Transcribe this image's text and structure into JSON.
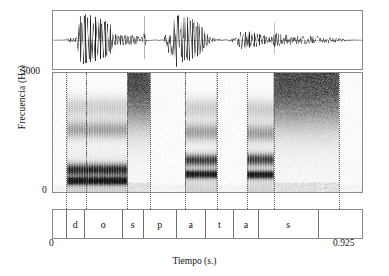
{
  "figure": {
    "type": "speech-spectrogram",
    "caption_language": "es"
  },
  "axes": {
    "y_label": "Frecuencia (Hz)",
    "y_ticks": [
      "5000",
      "0"
    ],
    "y_min": 0,
    "y_max": 5000,
    "x_label": "Tiempo (s.)",
    "x_ticks": [
      "0",
      "0.925"
    ],
    "x_min": 0,
    "x_max": 0.925
  },
  "segmentation": {
    "label_row": [
      {
        "label": "",
        "start": 0.0,
        "end": 0.042
      },
      {
        "label": "d",
        "start": 0.042,
        "end": 0.1
      },
      {
        "label": "o",
        "start": 0.1,
        "end": 0.222
      },
      {
        "label": "s",
        "start": 0.222,
        "end": 0.29
      },
      {
        "label": "p",
        "start": 0.29,
        "end": 0.395
      },
      {
        "label": "a",
        "start": 0.395,
        "end": 0.49
      },
      {
        "label": "t",
        "start": 0.49,
        "end": 0.58
      },
      {
        "label": "a",
        "start": 0.58,
        "end": 0.66
      },
      {
        "label": "s",
        "start": 0.66,
        "end": 0.855
      },
      {
        "label": "",
        "start": 0.855,
        "end": 0.925
      }
    ],
    "utterance": "dos patas"
  },
  "chart_data": {
    "type": "line",
    "title": "",
    "xlabel": "Tiempo (s.)",
    "ylabel": "Frecuencia (Hz)",
    "xlim": [
      0,
      0.925
    ],
    "ylim": [
      0,
      5000
    ],
    "grid": false,
    "panels": [
      {
        "name": "waveform",
        "type": "line",
        "ylabel": "",
        "description": "Oscillogram of the Spanish utterance 'dos patas'",
        "envelope": [
          [
            0.0,
            0.01
          ],
          [
            0.03,
            0.01
          ],
          [
            0.04,
            0.05
          ],
          [
            0.055,
            0.09
          ],
          [
            0.068,
            0.07
          ],
          [
            0.08,
            0.9
          ],
          [
            0.095,
            0.97
          ],
          [
            0.11,
            0.93
          ],
          [
            0.125,
            0.88
          ],
          [
            0.14,
            0.8
          ],
          [
            0.155,
            0.72
          ],
          [
            0.17,
            0.62
          ],
          [
            0.18,
            0.22
          ],
          [
            0.2,
            0.2
          ],
          [
            0.225,
            0.19
          ],
          [
            0.25,
            0.17
          ],
          [
            0.262,
            0.04
          ],
          [
            0.272,
            0.38
          ],
          [
            0.28,
            0.05
          ],
          [
            0.3,
            0.02
          ],
          [
            0.33,
            0.02
          ],
          [
            0.35,
            0.6
          ],
          [
            0.362,
            0.97
          ],
          [
            0.38,
            0.92
          ],
          [
            0.4,
            0.86
          ],
          [
            0.42,
            0.76
          ],
          [
            0.44,
            0.6
          ],
          [
            0.455,
            0.3
          ],
          [
            0.47,
            0.1
          ],
          [
            0.49,
            0.04
          ],
          [
            0.52,
            0.03
          ],
          [
            0.545,
            0.12
          ],
          [
            0.56,
            0.3
          ],
          [
            0.575,
            0.34
          ],
          [
            0.595,
            0.3
          ],
          [
            0.615,
            0.24
          ],
          [
            0.635,
            0.16
          ],
          [
            0.65,
            0.08
          ],
          [
            0.665,
            0.3
          ],
          [
            0.68,
            0.26
          ],
          [
            0.7,
            0.2
          ],
          [
            0.725,
            0.18
          ],
          [
            0.75,
            0.17
          ],
          [
            0.78,
            0.15
          ],
          [
            0.81,
            0.12
          ],
          [
            0.84,
            0.09
          ],
          [
            0.87,
            0.05
          ],
          [
            0.9,
            0.02
          ],
          [
            0.925,
            0.01
          ]
        ]
      },
      {
        "name": "spectrogram",
        "type": "heatmap",
        "ylabel": "Frecuencia (Hz)",
        "ylim": [
          0,
          5000
        ],
        "description": "Wideband spectrogram, grayscale, 0-5000 Hz",
        "voiced_regions": [
          [
            0.042,
            0.1
          ],
          [
            0.1,
            0.222
          ],
          [
            0.395,
            0.49
          ],
          [
            0.58,
            0.66
          ]
        ],
        "fricative_regions": [
          [
            0.222,
            0.29
          ],
          [
            0.66,
            0.855
          ]
        ]
      }
    ]
  },
  "colors": {
    "border": "#8a8a8a",
    "ink": "#111111",
    "boundary": "#5a5a5a",
    "background": "#ffffff"
  }
}
